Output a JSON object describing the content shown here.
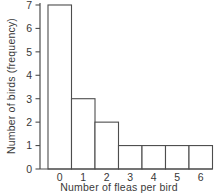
{
  "chart_data": {
    "type": "bar",
    "subtype": "histogram",
    "title": "",
    "xlabel": "Number of fleas per bird",
    "ylabel": "Number of birds (frequency)",
    "categories": [
      "0",
      "1",
      "2",
      "3",
      "4",
      "5",
      "6"
    ],
    "values": [
      7,
      3,
      2,
      1,
      1,
      1,
      1
    ],
    "ylim": [
      0,
      7
    ],
    "yticks": [
      "0",
      "1",
      "2",
      "3",
      "4",
      "5",
      "6",
      "7"
    ],
    "grid": false,
    "legend": "none",
    "bar_fill": "#ffffff",
    "line_color": "#4d4d4d",
    "text_color": "#383838",
    "background": "#ffffff"
  }
}
